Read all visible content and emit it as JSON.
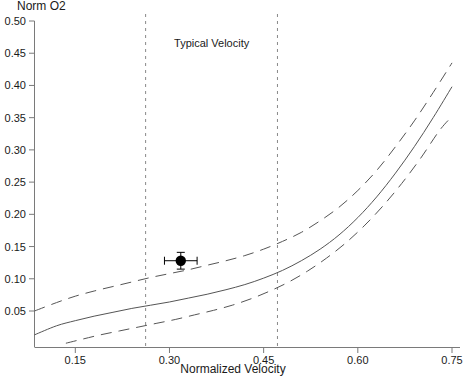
{
  "chart_data": {
    "type": "line",
    "title": "",
    "xlabel": "Normalized Velocity",
    "ylabel": "Norm O2",
    "xlim": [
      0.085,
      0.765
    ],
    "ylim": [
      0.0,
      0.5
    ],
    "grid": false,
    "legend_position": "none",
    "xticks": [
      "0.15",
      "0.30",
      "0.45",
      "0.60",
      "0.75"
    ],
    "xtick_values": [
      0.15,
      0.3,
      0.45,
      0.6,
      0.75
    ],
    "yticks": [
      "0.05",
      "0.10",
      "0.15",
      "0.20",
      "0.25",
      "0.30",
      "0.35",
      "0.40",
      "0.45",
      "0.50"
    ],
    "ytick_values": [
      0.05,
      0.1,
      0.15,
      0.2,
      0.25,
      0.3,
      0.35,
      0.4,
      0.45,
      0.5
    ],
    "series": [
      {
        "name": "Upper bound",
        "style": "dashed",
        "color": "#555555",
        "x": [
          0.085,
          0.12,
          0.15,
          0.18,
          0.21,
          0.24,
          0.27,
          0.3,
          0.33,
          0.36,
          0.39,
          0.42,
          0.45,
          0.48,
          0.51,
          0.54,
          0.57,
          0.6,
          0.63,
          0.66,
          0.69,
          0.72,
          0.75
        ],
        "y": [
          0.05,
          0.063,
          0.073,
          0.081,
          0.088,
          0.095,
          0.102,
          0.108,
          0.114,
          0.121,
          0.128,
          0.136,
          0.146,
          0.158,
          0.172,
          0.19,
          0.211,
          0.237,
          0.268,
          0.305,
          0.345,
          0.389,
          0.435
        ]
      },
      {
        "name": "Central estimate",
        "style": "solid",
        "color": "#555555",
        "x": [
          0.085,
          0.12,
          0.15,
          0.18,
          0.21,
          0.24,
          0.27,
          0.3,
          0.33,
          0.36,
          0.39,
          0.42,
          0.45,
          0.48,
          0.51,
          0.54,
          0.57,
          0.6,
          0.63,
          0.66,
          0.69,
          0.72,
          0.75
        ],
        "y": [
          0.013,
          0.027,
          0.035,
          0.042,
          0.048,
          0.054,
          0.059,
          0.064,
          0.07,
          0.076,
          0.083,
          0.091,
          0.101,
          0.113,
          0.128,
          0.146,
          0.168,
          0.195,
          0.227,
          0.264,
          0.305,
          0.35,
          0.398
        ]
      },
      {
        "name": "Lower bound",
        "style": "dashed",
        "color": "#555555",
        "x": [
          0.135,
          0.16,
          0.19,
          0.22,
          0.25,
          0.28,
          0.31,
          0.34,
          0.37,
          0.4,
          0.43,
          0.46,
          0.49,
          0.52,
          0.55,
          0.58,
          0.61,
          0.64,
          0.67,
          0.7,
          0.73,
          0.75
        ],
        "y": [
          0.0,
          0.006,
          0.013,
          0.019,
          0.025,
          0.031,
          0.037,
          0.044,
          0.051,
          0.059,
          0.069,
          0.081,
          0.095,
          0.112,
          0.132,
          0.155,
          0.182,
          0.213,
          0.248,
          0.287,
          0.33,
          0.352
        ]
      }
    ],
    "points": [
      {
        "name": "measured-point",
        "x": 0.318,
        "y": 0.128,
        "xerr": 0.026,
        "yerr": 0.013,
        "marker": "filled-circle",
        "color": "#000000"
      }
    ],
    "vertical_lines": [
      {
        "name": "typical-velocity-lower",
        "x": 0.262,
        "style": "dashed",
        "color": "#888888"
      },
      {
        "name": "typical-velocity-upper",
        "x": 0.472,
        "style": "dashed",
        "color": "#888888"
      }
    ],
    "annotations": [
      {
        "name": "typical-velocity-label",
        "text": "Typical Velocity",
        "x": 0.367,
        "y": 0.465
      }
    ]
  }
}
